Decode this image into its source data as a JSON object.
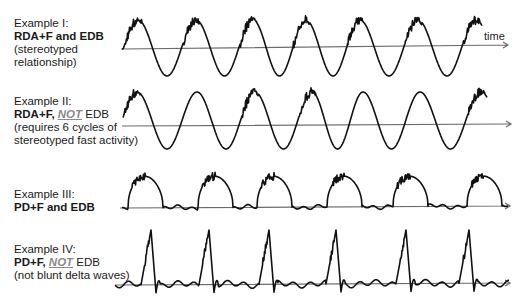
{
  "examples": [
    {
      "title": "Example I:",
      "bold": "RDA+F and EDB",
      "not": "",
      "rest": "",
      "desc": [
        "(stereotyped",
        "relationship)"
      ],
      "axis": {
        "x1": 121,
        "y1": 49,
        "x2": 508,
        "y2": 45
      },
      "time_label": "time",
      "waveform": {
        "type": "sine",
        "peaks": [
          138,
          196,
          253,
          306,
          360,
          418,
          476
        ],
        "fast": [
          true,
          true,
          true,
          true,
          true,
          true,
          true
        ],
        "peak_y": 20,
        "trough_y": 76
      }
    },
    {
      "title": "Example II:",
      "bold": "RDA+F, ",
      "not": "NOT",
      "rest": " EDB",
      "desc": [
        "(requires 6 cycles of",
        "stereotyped fast activity)"
      ],
      "axis": {
        "x1": 122,
        "y1": 126,
        "x2": 511,
        "y2": 124
      },
      "time_label": "",
      "waveform": {
        "type": "sine",
        "peaks": [
          137,
          197,
          255,
          312,
          363,
          420,
          481
        ],
        "fast": [
          true,
          false,
          true,
          true,
          false,
          false,
          true
        ],
        "peak_y": 92,
        "trough_y": 149
      }
    },
    {
      "title": "Example III:",
      "bold": "PD+F and EDB",
      "not": "",
      "rest": "",
      "desc": [],
      "axis": {
        "x1": 120,
        "y1": 208,
        "x2": 510,
        "y2": 206
      },
      "time_label": "",
      "waveform": {
        "type": "dome",
        "starts": [
          128,
          198,
          257,
          327,
          393,
          467
        ],
        "width": 35,
        "peak_y": 175
      }
    },
    {
      "title": "Example IV:",
      "bold": "PD+F, ",
      "not": "NOT",
      "rest": " EDB",
      "desc": [
        "(not blunt delta waves)"
      ],
      "axis": {
        "x1": 115,
        "y1": 285,
        "x2": 510,
        "y2": 283
      },
      "time_label": "",
      "waveform": {
        "type": "spike",
        "peaks": [
          151,
          209,
          269,
          336,
          406,
          469
        ],
        "peak_y": 230
      }
    }
  ],
  "colors": {
    "wave": "#111111",
    "axis": "#6b6b6b",
    "not_text": "#8a8a8a"
  }
}
